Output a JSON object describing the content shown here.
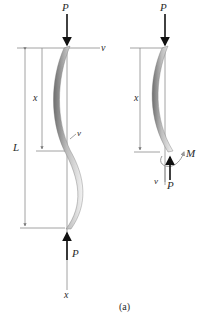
{
  "figure": {
    "caption": "(a)",
    "left_diagram": {
      "top_load_label": "P",
      "bottom_load_label": "P",
      "deflection_axis_label": "v",
      "length_label": "L",
      "position_label": "x",
      "local_deflection_label": "v",
      "longitudinal_axis_label": "x"
    },
    "right_diagram": {
      "top_load_label": "P",
      "position_label": "x",
      "moment_label": "M",
      "deflection_label": "v",
      "axial_force_label": "P"
    }
  },
  "colors": {
    "column_dark": "#7a7a7a",
    "column_light": "#e8e8e8",
    "dimension_line": "#8a8a8a",
    "force_arrow": "#111111",
    "moment_arrow": "#9a9a9a"
  }
}
